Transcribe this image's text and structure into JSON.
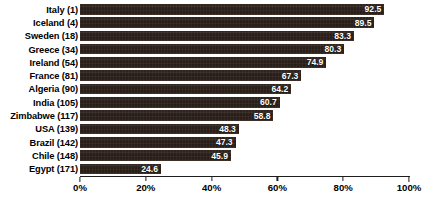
{
  "chart_data": {
    "type": "bar",
    "orientation": "horizontal",
    "title": "",
    "xlabel": "",
    "ylabel": "",
    "xlim": [
      0,
      100
    ],
    "xticks": [
      "0%",
      "20%",
      "40%",
      "60%",
      "80%",
      "100%"
    ],
    "xtick_values": [
      0,
      20,
      40,
      60,
      80,
      100
    ],
    "grid": false,
    "legend": "none",
    "bar_color": "#2b201b",
    "value_label_color": "#ffffff",
    "categories": [
      "Italy (1)",
      "Iceland (4)",
      "Sweden (18)",
      "Greece (34)",
      "Ireland (54)",
      "France (81)",
      "Algeria (90)",
      "India (105)",
      "Zimbabwe (117)",
      "USA (139)",
      "Brazil (142)",
      "Chile (148)",
      "Egypt (171)"
    ],
    "values": [
      92.5,
      89.5,
      83.3,
      80.3,
      74.9,
      67.3,
      64.2,
      60.7,
      58.8,
      48.3,
      47.3,
      45.9,
      24.6
    ],
    "value_labels": [
      "92.5",
      "89.5",
      "83.3",
      "80.3",
      "74.9",
      "67.3",
      "64.2",
      "60.7",
      "58.8",
      "48.3",
      "47.3",
      "45.9",
      "24.6"
    ]
  }
}
